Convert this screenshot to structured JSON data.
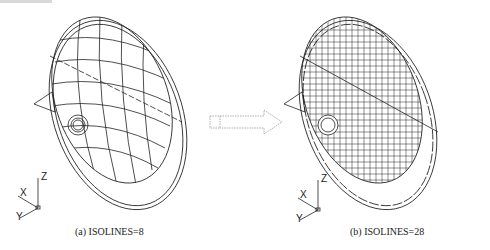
{
  "figure": {
    "panels": [
      {
        "id": "a",
        "caption": "(a) ISOLINES=8",
        "isolines": 8
      },
      {
        "id": "b",
        "caption": "(b) ISOLINES=28",
        "isolines": 28
      }
    ],
    "arrow": "right-arrow",
    "axis_labels": {
      "z": "Z",
      "x": "X",
      "y": "Y"
    },
    "colors": {
      "line": "#222222",
      "arrow": "#999999",
      "background": "#ffffff"
    }
  }
}
